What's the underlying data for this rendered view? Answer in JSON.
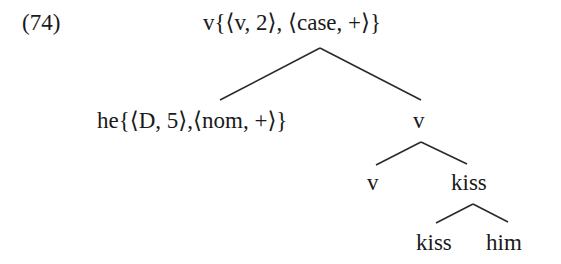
{
  "example": {
    "number": "(74)"
  },
  "tree": {
    "root": {
      "label": "v{⟨v, 2⟩, ⟨case, +⟩}"
    },
    "specifier": {
      "label": "he{⟨D, 5⟩,⟨nom, +⟩}"
    },
    "vbar": {
      "label": "v"
    },
    "v_head": {
      "label": "v"
    },
    "vp": {
      "label": "kiss"
    },
    "verb": {
      "label": "kiss"
    },
    "object": {
      "label": "him"
    }
  },
  "colors": {
    "ink": "#1a1a1a",
    "background": "#ffffff"
  }
}
